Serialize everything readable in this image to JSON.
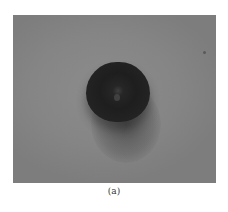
{
  "figure": {
    "caption": "(a)",
    "photo": {
      "subject": "dark round sample on gray surface",
      "background_color": "#858585",
      "object_color": "#222222"
    }
  }
}
